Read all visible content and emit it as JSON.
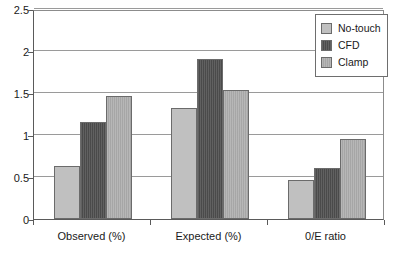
{
  "chart_data": {
    "type": "bar",
    "title": "",
    "subtitle": "",
    "xlabel": "",
    "ylabel": "",
    "categories": [
      "Observed (%)",
      "Expected (%)",
      "0/E ratio"
    ],
    "series": [
      {
        "name": "No-touch",
        "color": "#c0c0c0",
        "values": [
          0.63,
          1.32,
          0.47
        ]
      },
      {
        "name": "CFD",
        "color": "#4f4f4f",
        "values": [
          1.16,
          1.91,
          0.61
        ]
      },
      {
        "name": "Clamp",
        "color": "#adadad",
        "values": [
          1.46,
          1.54,
          0.95
        ]
      }
    ],
    "ylim": [
      0,
      2.5
    ],
    "y_ticks": [
      0,
      0.5,
      1,
      1.5,
      2,
      2.5
    ],
    "y_tick_labels": [
      "0",
      "0.5",
      "1",
      "1.5",
      "2",
      "2.5"
    ],
    "grid": "horizontal",
    "legend_position": "top-right",
    "annotations": []
  },
  "legend": {
    "items": [
      {
        "label": "No-touch"
      },
      {
        "label": "CFD"
      },
      {
        "label": "Clamp"
      }
    ]
  }
}
